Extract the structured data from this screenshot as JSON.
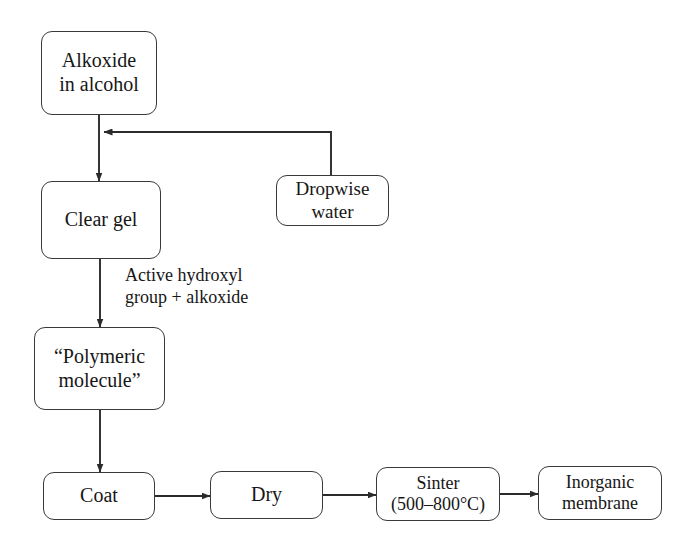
{
  "diagram": {
    "type": "flowchart",
    "background_color": "#ffffff",
    "line_color": "#2b2b2b",
    "text_color": "#161616",
    "nodes": [
      {
        "id": "alkoxide",
        "label": "Alkoxide\nin alcohol"
      },
      {
        "id": "clear_gel",
        "label": "Clear gel"
      },
      {
        "id": "dropwise",
        "label": "Dropwise\nwater"
      },
      {
        "id": "polymeric",
        "label": "“Polymeric\nmolecule”"
      },
      {
        "id": "coat",
        "label": "Coat"
      },
      {
        "id": "dry",
        "label": "Dry"
      },
      {
        "id": "sinter",
        "label": "Sinter\n(500–800°C)"
      },
      {
        "id": "membrane",
        "label": "Inorganic\nmembrane"
      }
    ],
    "edge_labels": [
      {
        "id": "active_hydroxyl",
        "label": "Active hydroxyl\ngroup + alkoxide"
      }
    ],
    "edges": [
      {
        "from": "alkoxide",
        "to": "clear_gel",
        "label": ""
      },
      {
        "from": "dropwise",
        "to": "alkoxide_outlet",
        "label": ""
      },
      {
        "from": "clear_gel",
        "to": "polymeric",
        "label": "Active hydroxyl group + alkoxide"
      },
      {
        "from": "polymeric",
        "to": "coat",
        "label": ""
      },
      {
        "from": "coat",
        "to": "dry",
        "label": ""
      },
      {
        "from": "dry",
        "to": "sinter",
        "label": ""
      },
      {
        "from": "sinter",
        "to": "membrane",
        "label": ""
      }
    ]
  }
}
